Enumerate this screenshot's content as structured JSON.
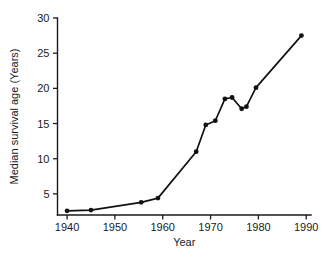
{
  "chart_data": {
    "type": "line",
    "title": "",
    "xlabel": "Year",
    "ylabel": "Median survival age (Years)",
    "xlim": [
      1938,
      1991
    ],
    "ylim": [
      2,
      30
    ],
    "xticks": [
      1940,
      1950,
      1960,
      1970,
      1980,
      1990
    ],
    "xtick_labels": [
      "1940",
      "1950",
      "1960",
      "1970",
      "1980",
      "1990"
    ],
    "yticks": [
      5,
      10,
      15,
      20,
      25,
      30
    ],
    "ytick_labels": [
      "5",
      "10",
      "15",
      "20",
      "25",
      "30"
    ],
    "grid": false,
    "legend": null,
    "marker": "filled-circle",
    "line_color": "#111111",
    "x": [
      1940,
      1945,
      1955.5,
      1959,
      1967,
      1969,
      1971,
      1973,
      1974.5,
      1976.5,
      1977.5,
      1979.5,
      1989
    ],
    "values": [
      2.6,
      2.7,
      3.8,
      4.4,
      11.0,
      14.8,
      15.4,
      18.5,
      18.7,
      17.1,
      17.4,
      20.1,
      27.5
    ],
    "series": [
      {
        "name": "Median survival age",
        "points": [
          {
            "x": 1940,
            "y": 2.6
          },
          {
            "x": 1945,
            "y": 2.7
          },
          {
            "x": 1955.5,
            "y": 3.8
          },
          {
            "x": 1959,
            "y": 4.4
          },
          {
            "x": 1967,
            "y": 11.0
          },
          {
            "x": 1969,
            "y": 14.8
          },
          {
            "x": 1971,
            "y": 15.4
          },
          {
            "x": 1973,
            "y": 18.5
          },
          {
            "x": 1974.5,
            "y": 18.7
          },
          {
            "x": 1976.5,
            "y": 17.1
          },
          {
            "x": 1977.5,
            "y": 17.4
          },
          {
            "x": 1979.5,
            "y": 20.1
          },
          {
            "x": 1989,
            "y": 27.5
          }
        ]
      }
    ]
  }
}
